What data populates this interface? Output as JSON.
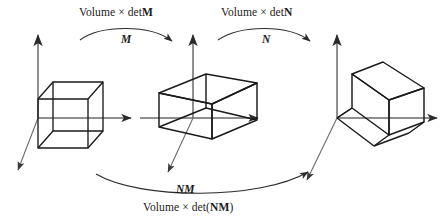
{
  "figure": {
    "stroke_color": "#1a1a1a",
    "axis_color": "#5a5a5a",
    "background": "#ffffff"
  },
  "labels": {
    "volume_det_m": {
      "text": "Volume × detM",
      "prefix": "Volume ",
      "times": "×",
      "det": " det",
      "matrix": "M"
    },
    "volume_det_n": {
      "text": "Volume × detN",
      "prefix": "Volume ",
      "times": "×",
      "det": " det",
      "matrix": "N"
    },
    "volume_det_nm": {
      "text": "Volume × det(NM)",
      "prefix": "Volume ",
      "times": "×",
      "det": " det(",
      "matrix": "NM",
      "suffix": ")"
    },
    "arrow_m": "M",
    "arrow_n": "N",
    "arrow_nm": "NM"
  },
  "shapes": [
    {
      "name": "unit-cube",
      "description": "Axis-aligned unit cube at origin",
      "position": "left"
    },
    {
      "name": "transformed-box-m",
      "description": "Parallelepiped after applying matrix M",
      "position": "center"
    },
    {
      "name": "transformed-box-nm",
      "description": "Parallelepiped after applying matrix N to M result",
      "position": "right"
    }
  ],
  "axes": [
    {
      "name": "axes-left",
      "origin_label": "",
      "count": 3
    },
    {
      "name": "axes-center",
      "origin_label": "",
      "count": 3
    },
    {
      "name": "axes-right",
      "origin_label": "",
      "count": 3
    }
  ],
  "arrows": [
    {
      "name": "arc-m",
      "label": "M",
      "from": "unit-cube",
      "to": "transformed-box-m"
    },
    {
      "name": "arc-n",
      "label": "N",
      "from": "transformed-box-m",
      "to": "transformed-box-nm"
    },
    {
      "name": "arc-nm",
      "label": "NM",
      "from": "unit-cube",
      "to": "transformed-box-nm"
    }
  ]
}
